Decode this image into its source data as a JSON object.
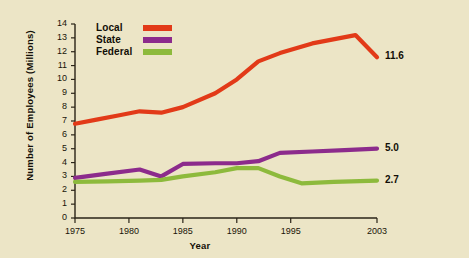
{
  "chart_data": {
    "type": "line",
    "title": "",
    "xlabel": "Year",
    "ylabel": "Number of Employees (Millions)",
    "xlim": [
      1975,
      2003
    ],
    "ylim": [
      0,
      14
    ],
    "grid": false,
    "legend_position": "top-left",
    "ytick_labels": [
      "0",
      "1",
      "2",
      "3",
      "4",
      "5",
      "6",
      "7",
      "8",
      "9",
      "10",
      "11",
      "12",
      "13",
      "14"
    ],
    "ytick_values": [
      0,
      1,
      2,
      3,
      4,
      5,
      6,
      7,
      8,
      9,
      10,
      11,
      12,
      13,
      14
    ],
    "xtick_labels": [
      "1975",
      "1980",
      "1985",
      "1990",
      "1995",
      "2003"
    ],
    "xtick_values": [
      1975,
      1980,
      1985,
      1990,
      1995,
      2003
    ],
    "series": [
      {
        "name": "Local",
        "color": "#e23a18",
        "end_label": "11.6",
        "x": [
          1975,
          1977,
          1979,
          1981,
          1983,
          1985,
          1988,
          1990,
          1992,
          1994,
          1997,
          2001,
          2003
        ],
        "values": [
          6.8,
          7.1,
          7.4,
          7.7,
          7.6,
          8.0,
          9.0,
          10.0,
          11.3,
          11.9,
          12.6,
          13.2,
          11.6
        ]
      },
      {
        "name": "State",
        "color": "#8c2b8c",
        "end_label": "5.0",
        "x": [
          1975,
          1978,
          1981,
          1983,
          1985,
          1988,
          1990,
          1992,
          1994,
          1997,
          2000,
          2003
        ],
        "values": [
          2.9,
          3.2,
          3.5,
          3.0,
          3.9,
          3.95,
          3.95,
          4.1,
          4.7,
          4.8,
          4.9,
          5.0
        ]
      },
      {
        "name": "Federal",
        "color": "#8dba3c",
        "end_label": "2.7",
        "x": [
          1975,
          1978,
          1981,
          1983,
          1985,
          1988,
          1990,
          1992,
          1994,
          1996,
          1999,
          2003
        ],
        "values": [
          2.6,
          2.65,
          2.7,
          2.75,
          3.0,
          3.3,
          3.6,
          3.6,
          3.0,
          2.5,
          2.6,
          2.7
        ]
      }
    ]
  },
  "legend": {
    "items": [
      {
        "label": "Local",
        "color": "#e23a18"
      },
      {
        "label": "State",
        "color": "#8c2b8c"
      },
      {
        "label": "Federal",
        "color": "#8dba3c"
      }
    ]
  },
  "axes": {
    "x_title": "Year",
    "y_title": "Number of Employees (Millions)"
  },
  "colors": {
    "background": "#ece5c6",
    "page": "#ffffff",
    "axis": "#2a2418",
    "local": "#e23a18",
    "state": "#8c2b8c",
    "federal": "#8dba3c"
  }
}
